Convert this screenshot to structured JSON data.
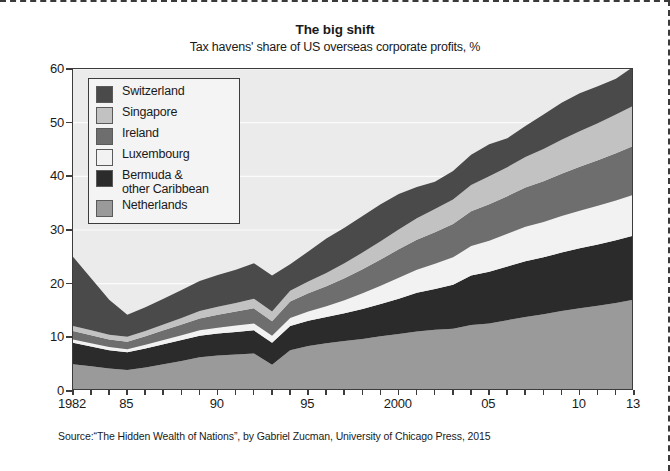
{
  "chart_data": {
    "type": "area",
    "title": "The big shift",
    "subtitle": "Tax havens' share of US overseas corporate profits, %",
    "xlabel": "",
    "ylabel": "",
    "stacked": true,
    "grid": true,
    "legend_position": "top-left",
    "ylim": [
      0,
      60
    ],
    "yticks": [
      0,
      10,
      20,
      30,
      40,
      50,
      60
    ],
    "ytick_labels": [
      "0",
      "10",
      "20",
      "30",
      "40",
      "50",
      "60"
    ],
    "xlim": [
      1982,
      2013
    ],
    "x": [
      1982,
      1983,
      1984,
      1985,
      1986,
      1987,
      1988,
      1989,
      1990,
      1991,
      1992,
      1993,
      1994,
      1995,
      1996,
      1997,
      1998,
      1999,
      2000,
      2001,
      2002,
      2003,
      2004,
      2005,
      2006,
      2007,
      2008,
      2009,
      2010,
      2011,
      2012,
      2013
    ],
    "xticks": [
      1982,
      1983,
      1984,
      1985,
      1986,
      1987,
      1988,
      1989,
      1990,
      1991,
      1992,
      1993,
      1994,
      1995,
      1996,
      1997,
      1998,
      1999,
      2000,
      2001,
      2002,
      2003,
      2004,
      2005,
      2006,
      2007,
      2008,
      2009,
      2010,
      2011,
      2012,
      2013
    ],
    "xtick_labels": [
      {
        "x": 1982,
        "label": "1982"
      },
      {
        "x": 1985,
        "label": "85"
      },
      {
        "x": 1990,
        "label": "90"
      },
      {
        "x": 1995,
        "label": "95"
      },
      {
        "x": 2000,
        "label": "2000"
      },
      {
        "x": 2005,
        "label": "05"
      },
      {
        "x": 2010,
        "label": "10"
      },
      {
        "x": 2013,
        "label": "13"
      }
    ],
    "series": [
      {
        "name": "Netherlands",
        "color": "#9a9a9a",
        "values": [
          5.0,
          4.6,
          4.2,
          3.9,
          4.4,
          5.0,
          5.6,
          6.3,
          6.6,
          6.8,
          7.0,
          4.9,
          7.6,
          8.4,
          8.9,
          9.3,
          9.7,
          10.2,
          10.6,
          11.1,
          11.4,
          11.6,
          12.3,
          12.6,
          13.2,
          13.8,
          14.3,
          14.9,
          15.4,
          15.9,
          16.4,
          17.0
        ]
      },
      {
        "name": "Bermuda & other Caribbean",
        "color": "#2b2b2b",
        "values": [
          4.0,
          3.7,
          3.4,
          3.3,
          3.5,
          3.7,
          3.9,
          4.0,
          4.1,
          4.2,
          4.3,
          4.1,
          4.5,
          4.7,
          4.9,
          5.2,
          5.6,
          6.0,
          6.6,
          7.2,
          7.6,
          8.2,
          9.2,
          9.6,
          10.0,
          10.4,
          10.6,
          10.9,
          11.2,
          11.4,
          11.7,
          12.0
        ]
      },
      {
        "name": "Luxembourg",
        "color": "#f2f2f2",
        "values": [
          0.6,
          0.6,
          0.6,
          0.6,
          0.7,
          0.8,
          0.9,
          1.0,
          1.1,
          1.2,
          1.3,
          1.3,
          1.5,
          1.7,
          2.0,
          2.4,
          2.9,
          3.4,
          3.9,
          4.3,
          4.7,
          5.1,
          5.5,
          5.8,
          6.1,
          6.4,
          6.6,
          6.8,
          7.0,
          7.2,
          7.4,
          7.6
        ]
      },
      {
        "name": "Ireland",
        "color": "#6e6e6e",
        "values": [
          1.6,
          1.5,
          1.4,
          1.4,
          1.6,
          1.8,
          2.0,
          2.2,
          2.4,
          2.6,
          2.8,
          2.7,
          3.1,
          3.4,
          3.7,
          4.1,
          4.5,
          4.9,
          5.3,
          5.6,
          5.9,
          6.2,
          6.5,
          6.8,
          7.0,
          7.3,
          7.6,
          7.9,
          8.2,
          8.5,
          8.8,
          9.1
        ]
      },
      {
        "name": "Singapore",
        "color": "#c2c2c2",
        "values": [
          0.9,
          0.9,
          0.9,
          0.9,
          1.0,
          1.1,
          1.2,
          1.4,
          1.5,
          1.6,
          1.8,
          1.8,
          2.0,
          2.2,
          2.5,
          2.8,
          3.1,
          3.4,
          3.7,
          4.0,
          4.3,
          4.6,
          4.9,
          5.2,
          5.4,
          5.7,
          6.0,
          6.3,
          6.6,
          6.9,
          7.2,
          7.5
        ]
      },
      {
        "name": "Switzerland",
        "color": "#4a4a4a",
        "values": [
          12.9,
          9.7,
          6.5,
          4.1,
          4.4,
          4.8,
          5.2,
          5.6,
          5.9,
          6.2,
          6.6,
          6.7,
          4.9,
          5.6,
          6.4,
          6.6,
          6.8,
          6.9,
          6.6,
          5.8,
          5.1,
          5.3,
          5.6,
          6.0,
          5.4,
          5.8,
          6.4,
          6.9,
          7.1,
          6.9,
          6.7,
          7.3
        ]
      }
    ],
    "totals": [
      25.0,
      21.0,
      17.0,
      14.2,
      15.6,
      17.2,
      18.8,
      20.5,
      21.6,
      22.6,
      23.8,
      21.5,
      23.6,
      26.0,
      28.4,
      30.4,
      32.6,
      34.8,
      36.7,
      38.0,
      39.0,
      41.0,
      44.0,
      46.0,
      47.1,
      49.4,
      51.5,
      53.7,
      55.5,
      56.8,
      58.2,
      60.5
    ]
  },
  "legend": {
    "items": [
      {
        "label": "Switzerland",
        "color": "#4a4a4a"
      },
      {
        "label": "Singapore",
        "color": "#c2c2c2"
      },
      {
        "label": "Ireland",
        "color": "#6e6e6e"
      },
      {
        "label": "Luxembourg",
        "color": "#f2f2f2"
      },
      {
        "label": "Bermuda &\nother Caribbean",
        "color": "#2b2b2b"
      },
      {
        "label": "Netherlands",
        "color": "#9a9a9a"
      }
    ]
  },
  "source": {
    "text": "Source:“The Hidden Wealth of Nations”, by Gabriel Zucman, University of Chicago Press, 2015"
  },
  "colors": {
    "plot_background": "#ebebeb",
    "axis": "#3c3c3c",
    "gridline": "#fbfbfb",
    "page_background": "#ffffff"
  }
}
